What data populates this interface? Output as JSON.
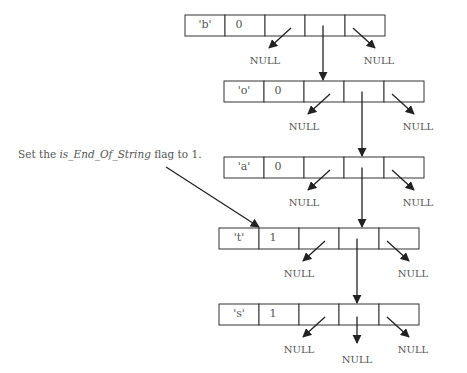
{
  "diagram": {
    "type": "trie-node-chain",
    "annotation": {
      "prefix": "Set the ",
      "italic": "is_End_Of_String",
      "suffix": " flag to 1."
    },
    "null_label": "NULL",
    "nodes": [
      {
        "char": "'b'",
        "flag": "0",
        "x": 185,
        "y": 15,
        "children": [
          "null-left",
          "down",
          "null-right"
        ]
      },
      {
        "char": "'o'",
        "flag": "0",
        "x": 224,
        "y": 81,
        "children": [
          "null-left",
          "down",
          "null-right"
        ]
      },
      {
        "char": "'a'",
        "flag": "0",
        "x": 224,
        "y": 157,
        "children": [
          "null-left",
          "down",
          "null-right"
        ]
      },
      {
        "char": "'t'",
        "flag": "1",
        "x": 219,
        "y": 228,
        "children": [
          "null-left",
          "down",
          "null-right"
        ]
      },
      {
        "char": "'s'",
        "flag": "1",
        "x": 219,
        "y": 304,
        "children": [
          "null-left",
          "null-down",
          "null-right"
        ]
      }
    ],
    "colors": {
      "line": "#222222",
      "text": "#555555",
      "background": "#ffffff"
    }
  }
}
